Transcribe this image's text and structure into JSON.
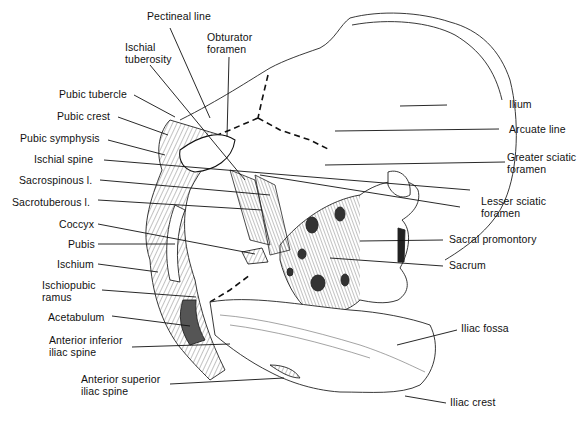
{
  "diagram": {
    "labels_left": [
      {
        "id": "pectineal-line",
        "text": "Pectineal line"
      },
      {
        "id": "ischial-tuberosity",
        "line1": "Ischial",
        "line2": "tuberosity"
      },
      {
        "id": "obturator-foramen",
        "line1": "Obturator",
        "line2": "foramen"
      },
      {
        "id": "pubic-tubercle",
        "text": "Pubic tubercle"
      },
      {
        "id": "pubic-crest",
        "text": "Pubic crest"
      },
      {
        "id": "pubic-symphysis",
        "text": "Pubic symphysis"
      },
      {
        "id": "ischial-spine",
        "text": "Ischial spine"
      },
      {
        "id": "sacrospinous-l",
        "text": "Sacrospinous l."
      },
      {
        "id": "sacrotuberous-l",
        "text": "Sacrotuberous l."
      },
      {
        "id": "coccyx",
        "text": "Coccyx"
      },
      {
        "id": "pubis",
        "text": "Pubis"
      },
      {
        "id": "ischium",
        "text": "Ischium"
      },
      {
        "id": "ischiopubic-ramus",
        "line1": "Ischiopubic",
        "line2": "ramus"
      },
      {
        "id": "acetabulum",
        "text": "Acetabulum"
      },
      {
        "id": "anterior-inferior-iliac-spine",
        "line1": "Anterior inferior",
        "line2": "iliac spine"
      },
      {
        "id": "anterior-superior-iliac-spine",
        "line1": "Anterior superior",
        "line2": "iliac spine"
      }
    ],
    "labels_right": [
      {
        "id": "ilium",
        "text": "Ilium"
      },
      {
        "id": "arcuate-line",
        "text": "Arcuate line"
      },
      {
        "id": "greater-sciatic-foramen",
        "line1": "Greater sciatic",
        "line2": "foramen"
      },
      {
        "id": "lesser-sciatic-foramen",
        "line1": "Lesser sciatic",
        "line2": "foramen"
      },
      {
        "id": "sacral-promontory",
        "text": "Sacral promontory"
      },
      {
        "id": "sacrum",
        "text": "Sacrum"
      },
      {
        "id": "iliac-fossa",
        "text": "Iliac fossa"
      },
      {
        "id": "iliac-crest",
        "text": "Iliac crest"
      }
    ],
    "colors": {
      "ink": "#111111",
      "background": "#ffffff",
      "shade": "#555555"
    }
  }
}
